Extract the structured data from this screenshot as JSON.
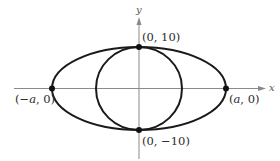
{
  "figure": {
    "type": "ellipse-and-circle-diagram",
    "axes": {
      "x_label": "x",
      "y_label": "y"
    },
    "curves": [
      {
        "name": "ellipse",
        "center": [
          0,
          0
        ],
        "semi_major_x": "a",
        "semi_minor_y": 10
      },
      {
        "name": "circle",
        "center": [
          0,
          0
        ],
        "radius": 10
      }
    ],
    "points": [
      {
        "id": "top",
        "label": "(0, 10)"
      },
      {
        "id": "bottom",
        "label": "(0, −10)"
      },
      {
        "id": "left",
        "label_pre": "(−",
        "label_var": "a",
        "label_post": ", 0)"
      },
      {
        "id": "right",
        "label_pre": "(",
        "label_var": "a",
        "label_post": ", 0)"
      }
    ],
    "colors": {
      "curve": "#1a1a1a",
      "axis": "#8a8a8a",
      "text": "#2a2a2a"
    }
  }
}
